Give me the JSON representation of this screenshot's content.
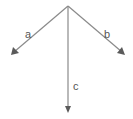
{
  "diagram": {
    "type": "vector-diagram",
    "origin": {
      "x": 68,
      "y": 6
    },
    "color": "#8a8a8a",
    "arrowhead_color": "#5a5a5a",
    "vectors": [
      {
        "name": "a",
        "label": "a",
        "end": {
          "x": 12,
          "y": 54
        },
        "label_pos": {
          "x": 26,
          "y": 37
        }
      },
      {
        "name": "b",
        "label": "b",
        "end": {
          "x": 125,
          "y": 55
        },
        "label_pos": {
          "x": 105,
          "y": 37
        }
      },
      {
        "name": "c",
        "label": "c",
        "end": {
          "x": 68,
          "y": 112
        },
        "label_pos": {
          "x": 73,
          "y": 89
        }
      }
    ]
  }
}
